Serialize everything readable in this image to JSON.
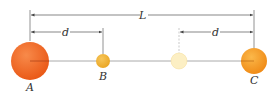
{
  "diagram": {
    "labels": {
      "L": "L",
      "d_left": "d",
      "d_right": "d",
      "A": "A",
      "B": "B",
      "C": "C"
    },
    "colors": {
      "sphere_A": "#f26a22",
      "sphere_B": "#f2b233",
      "sphere_faded": "#fbe9b0",
      "sphere_C": "#f59a22",
      "line": "#888888",
      "text": "#333333"
    }
  }
}
